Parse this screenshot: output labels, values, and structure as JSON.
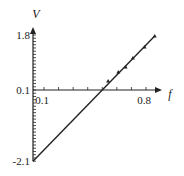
{
  "chart_data": {
    "type": "line",
    "title": "",
    "xlabel": "f",
    "ylabel": "V",
    "xlim": [
      0,
      0.95
    ],
    "ylim": [
      -2.1,
      1.95
    ],
    "x_tick_labels": [
      {
        "value": 0.1,
        "label": "0.1"
      },
      {
        "value": 0.8,
        "label": "0.8"
      }
    ],
    "y_tick_labels": [
      {
        "value": 1.8,
        "label": "1.8"
      },
      {
        "value": 0.1,
        "label": "0.1"
      },
      {
        "value": -2.1,
        "label": "-2.1"
      }
    ],
    "x_minor_ticks": [
      0.1,
      0.2,
      0.3,
      0.4,
      0.5,
      0.6,
      0.7,
      0.8
    ],
    "y_minor_tick_step": 0.1,
    "series": [
      {
        "name": "fit line",
        "x": [
          0.0,
          0.86
        ],
        "y": [
          -2.1,
          1.77
        ]
      },
      {
        "name": "data points",
        "x": [
          0.54,
          0.61,
          0.66,
          0.71,
          0.79,
          0.86
        ],
        "y": [
          0.38,
          0.66,
          0.81,
          1.09,
          1.43,
          1.77
        ]
      }
    ],
    "grid": false,
    "legend": "none"
  }
}
